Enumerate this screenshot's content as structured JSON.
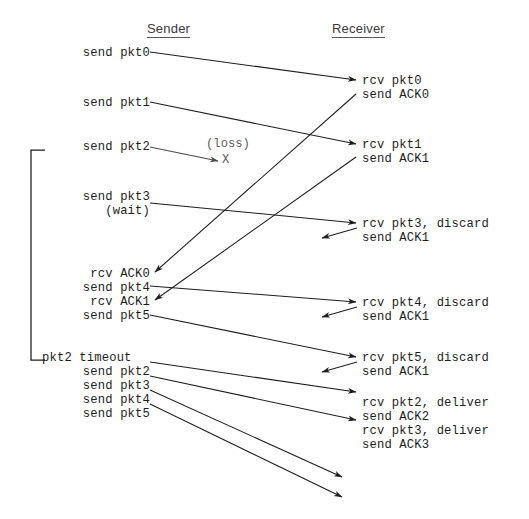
{
  "diagram": {
    "title_sender": "Sender",
    "title_receiver": "Receiver",
    "loss_label": "(loss)",
    "loss_marker": "X",
    "timeout_label": "pkt2 timeout",
    "sender_events": [
      {
        "id": "send-pkt0",
        "text": "send pkt0",
        "x": 68,
        "y": 46
      },
      {
        "id": "send-pkt1",
        "text": "send pkt1",
        "x": 68,
        "y": 96
      },
      {
        "id": "send-pkt2",
        "text": "send pkt2",
        "x": 68,
        "y": 140
      },
      {
        "id": "send-pkt3",
        "text": "send pkt3",
        "x": 68,
        "y": 190
      },
      {
        "id": "wait",
        "text": "(wait)",
        "x": 68,
        "y": 204
      },
      {
        "id": "rcv-ack0",
        "text": "rcv ACK0",
        "x": 68,
        "y": 267
      },
      {
        "id": "send-pkt4",
        "text": "send pkt4",
        "x": 68,
        "y": 281
      },
      {
        "id": "rcv-ack1",
        "text": "rcv ACK1",
        "x": 68,
        "y": 295
      },
      {
        "id": "send-pkt5",
        "text": "send pkt5",
        "x": 68,
        "y": 309
      },
      {
        "id": "resend-pkt2",
        "text": "send pkt2",
        "x": 68,
        "y": 365
      },
      {
        "id": "resend-pkt3",
        "text": "send pkt3",
        "x": 68,
        "y": 379
      },
      {
        "id": "resend-pkt4",
        "text": "send pkt4",
        "x": 68,
        "y": 393
      },
      {
        "id": "resend-pkt5",
        "text": "send pkt5",
        "x": 68,
        "y": 407
      }
    ],
    "receiver_events": [
      {
        "id": "rcv-pkt0",
        "text": "rcv pkt0",
        "x": 362,
        "y": 74
      },
      {
        "id": "send-ack0",
        "text": "send ACK0",
        "x": 362,
        "y": 88
      },
      {
        "id": "rcv-pkt1",
        "text": "rcv pkt1",
        "x": 362,
        "y": 138
      },
      {
        "id": "send-ack1-a",
        "text": "send ACK1",
        "x": 362,
        "y": 152
      },
      {
        "id": "rcv-pkt3-discard",
        "text": "rcv pkt3, discard",
        "x": 362,
        "y": 217
      },
      {
        "id": "send-ack1-b",
        "text": "send ACK1",
        "x": 362,
        "y": 231
      },
      {
        "id": "rcv-pkt4-discard",
        "text": "rcv pkt4, discard",
        "x": 362,
        "y": 296
      },
      {
        "id": "send-ack1-c",
        "text": "send ACK1",
        "x": 362,
        "y": 310
      },
      {
        "id": "rcv-pkt5-discard",
        "text": "rcv pkt5, discard",
        "x": 362,
        "y": 351
      },
      {
        "id": "send-ack1-d",
        "text": "send ACK1",
        "x": 362,
        "y": 365
      },
      {
        "id": "rcv-pkt2-deliver",
        "text": "rcv pkt2, deliver",
        "x": 362,
        "y": 396
      },
      {
        "id": "send-ack2",
        "text": "send ACK2",
        "x": 362,
        "y": 410
      },
      {
        "id": "rcv-pkt3-deliver",
        "text": "rcv pkt3, deliver",
        "x": 362,
        "y": 424
      },
      {
        "id": "send-ack3",
        "text": "send ACK3",
        "x": 362,
        "y": 438
      }
    ],
    "arrows": [
      {
        "id": "pkt0-transit",
        "kind": "data",
        "x1": 150,
        "y1": 52,
        "x2": 356,
        "y2": 80
      },
      {
        "id": "pkt1-transit",
        "kind": "data",
        "x1": 150,
        "y1": 102,
        "x2": 356,
        "y2": 144
      },
      {
        "id": "pkt2-loss",
        "kind": "lost",
        "x1": 150,
        "y1": 147,
        "x2": 218,
        "y2": 161
      },
      {
        "id": "pkt3-transit",
        "kind": "data",
        "x1": 150,
        "y1": 203,
        "x2": 356,
        "y2": 223
      },
      {
        "id": "pkt4-transit",
        "kind": "data",
        "x1": 150,
        "y1": 286,
        "x2": 356,
        "y2": 302
      },
      {
        "id": "pkt5-transit",
        "kind": "data",
        "x1": 150,
        "y1": 315,
        "x2": 356,
        "y2": 357
      },
      {
        "id": "ack0-transit",
        "kind": "ack",
        "x1": 356,
        "y1": 94,
        "x2": 155,
        "y2": 272
      },
      {
        "id": "ack1-transit",
        "kind": "ack",
        "x1": 356,
        "y1": 157,
        "x2": 155,
        "y2": 300
      },
      {
        "id": "ack1-b",
        "kind": "ack",
        "x1": 357,
        "y1": 228,
        "x2": 322,
        "y2": 238
      },
      {
        "id": "ack1-c",
        "kind": "ack",
        "x1": 357,
        "y1": 307,
        "x2": 322,
        "y2": 317
      },
      {
        "id": "ack1-d",
        "kind": "ack",
        "x1": 357,
        "y1": 362,
        "x2": 322,
        "y2": 372
      },
      {
        "id": "repkt2-transit",
        "kind": "data",
        "x1": 150,
        "y1": 362,
        "x2": 356,
        "y2": 392
      },
      {
        "id": "repkt3-transit",
        "kind": "data",
        "x1": 150,
        "y1": 376,
        "x2": 356,
        "y2": 420
      },
      {
        "id": "repkt4-transit",
        "kind": "data",
        "x1": 150,
        "y1": 390,
        "x2": 342,
        "y2": 477
      },
      {
        "id": "repkt5-transit",
        "kind": "data",
        "x1": 150,
        "y1": 404,
        "x2": 342,
        "y2": 497
      }
    ],
    "bracket": {
      "x": 31,
      "top": 150,
      "bottom": 360,
      "arm": 14
    }
  }
}
